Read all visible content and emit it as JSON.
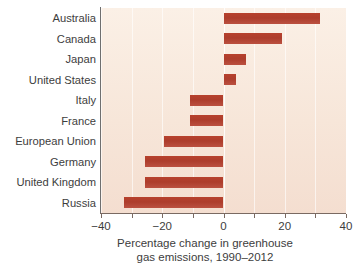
{
  "chart_data": {
    "type": "bar",
    "orientation": "horizontal",
    "title": "",
    "subtitle": "",
    "xlabel": "Percentage change in greenhouse gas emissions, 1990–2012",
    "xlabel_lines": [
      "Percentage change in greenhouse",
      "gas emissions, 1990–2012"
    ],
    "ylabel": "",
    "categories": [
      "Australia",
      "Canada",
      "Japan",
      "United States",
      "Italy",
      "France",
      "European Union",
      "Germany",
      "United Kingdom",
      "Russia"
    ],
    "values": [
      31.5,
      19,
      7.5,
      4,
      -11,
      -11,
      -19.5,
      -25.5,
      -25.5,
      -32.5
    ],
    "xlim": [
      -40,
      40
    ],
    "xticks": [
      -40,
      -30,
      -20,
      -10,
      0,
      10,
      20,
      30,
      40
    ],
    "xtick_labels": [
      "−40",
      "",
      "−20",
      "",
      "0",
      "",
      "20",
      "",
      "40"
    ],
    "grid": "vertical-faint",
    "legend": "none",
    "bar_color": "#b4412d",
    "plot_background": "#f7e6d9",
    "figure_background": "#ffffff",
    "axis_color": "#7a6a62",
    "text_color": "#3d3d3d"
  },
  "caption": {
    "fragment": "cut-off line of body text below figure"
  }
}
